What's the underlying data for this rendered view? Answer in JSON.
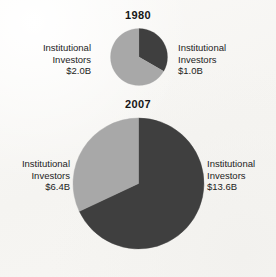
{
  "figure": {
    "background_color": "#f8f7f4",
    "dark_color": "#3f3f3f",
    "light_color": "#a8a8a8"
  },
  "charts": [
    {
      "title": "1980",
      "left_label": {
        "line1": "Institutional",
        "line2": "Investors",
        "line3": "$2.0B"
      },
      "right_label": {
        "line1": "Institutional",
        "line2": "Investors",
        "line3": "$1.0B"
      }
    },
    {
      "title": "2007",
      "left_label": {
        "line1": "Institutional",
        "line2": "Investors",
        "line3": "$6.4B"
      },
      "right_label": {
        "line1": "Institutional",
        "line2": "Investors",
        "line3": "$13.6B"
      }
    }
  ],
  "chart_data": [
    {
      "type": "pie",
      "title": "1980",
      "unit": "billions of USD",
      "total": 3.0,
      "categories": [
        "Institutional Investors $1.0B",
        "Institutional Investors $2.0B"
      ],
      "values": [
        1.0,
        2.0
      ],
      "labels": [
        "$1.0B",
        "$2.0B"
      ],
      "percentages": [
        33.3,
        66.7
      ],
      "start_angle_deg": 0,
      "direction": "clockwise",
      "colors": [
        "#3f3f3f",
        "#a8a8a8"
      ],
      "slice_angles_deg": [
        120,
        240
      ],
      "legend": "none",
      "grid": false,
      "diameter_px": 58
    },
    {
      "type": "pie",
      "title": "2007",
      "unit": "billions of USD",
      "total": 20.0,
      "categories": [
        "Institutional Investors $13.6B",
        "Institutional Investors $6.4B"
      ],
      "values": [
        13.6,
        6.4
      ],
      "labels": [
        "$13.6B",
        "$6.4B"
      ],
      "percentages": [
        68.0,
        32.0
      ],
      "start_angle_deg": 0,
      "direction": "clockwise",
      "colors": [
        "#3f3f3f",
        "#a8a8a8"
      ],
      "slice_angles_deg": [
        244.8,
        115.2
      ],
      "legend": "none",
      "grid": false,
      "diameter_px": 133
    }
  ]
}
